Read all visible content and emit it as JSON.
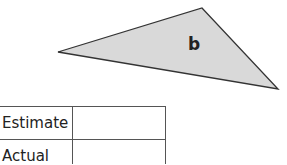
{
  "shape": {
    "label": "b",
    "type": "triangle",
    "fill": "#d9d9d9",
    "stroke": "#333333"
  },
  "table": {
    "rows": [
      {
        "label": "Estimate",
        "value": ""
      },
      {
        "label": "Actual",
        "value": ""
      }
    ]
  }
}
